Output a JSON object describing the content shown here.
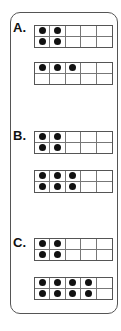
{
  "problems": [
    {
      "label": "A.",
      "label_top": 21,
      "frames": [
        {
          "top": 25,
          "counters": [
            1,
            1,
            0,
            0,
            0,
            1,
            1,
            0,
            0,
            0
          ]
        },
        {
          "top": 62,
          "counters": [
            1,
            1,
            1,
            0,
            0,
            0,
            0,
            0,
            0,
            0
          ]
        }
      ]
    },
    {
      "label": "B.",
      "label_top": 129,
      "frames": [
        {
          "top": 131,
          "counters": [
            1,
            1,
            0,
            0,
            0,
            1,
            1,
            0,
            0,
            0
          ]
        },
        {
          "top": 170,
          "counters": [
            1,
            1,
            1,
            0,
            0,
            1,
            1,
            1,
            0,
            0
          ]
        }
      ]
    },
    {
      "label": "C.",
      "label_top": 236,
      "frames": [
        {
          "top": 238,
          "counters": [
            1,
            1,
            0,
            0,
            0,
            1,
            1,
            0,
            0,
            0
          ]
        },
        {
          "top": 277,
          "counters": [
            1,
            1,
            1,
            1,
            0,
            1,
            1,
            1,
            1,
            0
          ]
        }
      ]
    }
  ],
  "colors": {
    "border": "#555555",
    "counter": "#111111"
  }
}
